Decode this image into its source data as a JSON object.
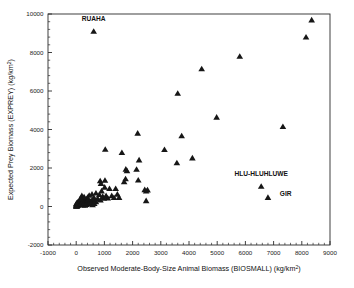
{
  "chart_data": {
    "type": "scatter",
    "title": "",
    "xlabel": "Observed Moderate-Body-Size Animal Biomass (BIOSMALL) (kg/km2)",
    "xlabel_main": "Observed Moderate-Body-Size Animal Biomass (BIOSMALL) (kg/km",
    "xlabel_sup": "2",
    "xlabel_tail": ")",
    "ylabel": "Expected Prey Biomass (EXPREY) (kg/km2)",
    "ylabel_main": "Expected Prey Biomass (EXPREY) (kg/km",
    "ylabel_sup": "2",
    "ylabel_tail": ")",
    "xlim": [
      -1000,
      9000
    ],
    "ylim": [
      -2000,
      10000
    ],
    "xticks": [
      -1000,
      0,
      1000,
      2000,
      3000,
      4000,
      5000,
      6000,
      7000,
      8000,
      9000
    ],
    "yticks": [
      -2000,
      0,
      2000,
      4000,
      6000,
      8000,
      10000
    ],
    "xtick_labels": [
      "-1000",
      "0",
      "1000",
      "2000",
      "3000",
      "4000",
      "5000",
      "6000",
      "7000",
      "8000",
      "9000"
    ],
    "ytick_labels": [
      "-2000",
      "0",
      "2000",
      "4000",
      "6000",
      "8000",
      "10000"
    ],
    "x_minor_interval": 200,
    "y_minor_interval": 400,
    "grid": false,
    "legend": "none",
    "marker": "triangle",
    "marker_color": "#161616",
    "series": [
      {
        "name": "Protected areas",
        "points": [
          [
            620,
            9100
          ],
          [
            8350,
            9690
          ],
          [
            8150,
            8800
          ],
          [
            5800,
            7800
          ],
          [
            4450,
            7150
          ],
          [
            3600,
            5880
          ],
          [
            4980,
            4640
          ],
          [
            7330,
            4150
          ],
          [
            2180,
            3810
          ],
          [
            3740,
            3670
          ],
          [
            1030,
            2970
          ],
          [
            3130,
            2960
          ],
          [
            1620,
            2800
          ],
          [
            4120,
            2520
          ],
          [
            2230,
            2420
          ],
          [
            3570,
            2270
          ],
          [
            1760,
            1940
          ],
          [
            2140,
            1930
          ],
          [
            1800,
            1860
          ],
          [
            1020,
            1360
          ],
          [
            1750,
            1440
          ],
          [
            2200,
            1370
          ],
          [
            850,
            1330
          ],
          [
            880,
            1200
          ],
          [
            6560,
            1050
          ],
          [
            1700,
            1280
          ],
          [
            1010,
            1000
          ],
          [
            1180,
            930
          ],
          [
            2430,
            870
          ],
          [
            2530,
            860
          ],
          [
            2480,
            800
          ],
          [
            900,
            810
          ],
          [
            6800,
            470
          ],
          [
            1520,
            470
          ],
          [
            2480,
            300
          ],
          [
            820,
            620
          ],
          [
            700,
            700
          ],
          [
            560,
            640
          ],
          [
            460,
            580
          ],
          [
            620,
            450
          ],
          [
            980,
            430
          ],
          [
            1120,
            440
          ],
          [
            700,
            250
          ],
          [
            530,
            300
          ],
          [
            400,
            470
          ],
          [
            350,
            380
          ],
          [
            300,
            300
          ],
          [
            260,
            260
          ],
          [
            220,
            420
          ],
          [
            180,
            330
          ],
          [
            160,
            200
          ],
          [
            140,
            160
          ],
          [
            120,
            250
          ],
          [
            100,
            180
          ],
          [
            90,
            120
          ],
          [
            80,
            260
          ],
          [
            70,
            90
          ],
          [
            60,
            200
          ],
          [
            55,
            150
          ],
          [
            50,
            60
          ],
          [
            45,
            110
          ],
          [
            40,
            210
          ],
          [
            35,
            70
          ],
          [
            30,
            140
          ],
          [
            28,
            40
          ],
          [
            25,
            180
          ],
          [
            22,
            95
          ],
          [
            20,
            30
          ],
          [
            18,
            130
          ],
          [
            15,
            60
          ],
          [
            12,
            20
          ],
          [
            10,
            100
          ],
          [
            8,
            45
          ],
          [
            6,
            150
          ],
          [
            5,
            15
          ],
          [
            200,
            560
          ],
          [
            240,
            250
          ],
          [
            280,
            500
          ],
          [
            320,
            180
          ],
          [
            380,
            220
          ],
          [
            420,
            340
          ],
          [
            480,
            250
          ],
          [
            600,
            320
          ],
          [
            660,
            380
          ],
          [
            760,
            420
          ],
          [
            860,
            330
          ],
          [
            940,
            520
          ],
          [
            1060,
            560
          ],
          [
            1260,
            560
          ],
          [
            1340,
            460
          ],
          [
            1400,
            930
          ],
          [
            1460,
            640
          ],
          [
            150,
            420
          ],
          [
            190,
            160
          ],
          [
            230,
            80
          ],
          [
            270,
            120
          ],
          [
            310,
            60
          ],
          [
            360,
            100
          ],
          [
            440,
            140
          ],
          [
            520,
            190
          ],
          [
            580,
            90
          ],
          [
            640,
            160
          ]
        ]
      }
    ],
    "annotations": [
      {
        "text": "RUAHA",
        "x": 620,
        "y": 9100,
        "dx": 0,
        "dy": 560,
        "anchor": "middle"
      },
      {
        "text": "HLU-HLUHLUWE",
        "x": 6560,
        "y": 1050,
        "dx": 0,
        "dy": 560,
        "anchor": "middle"
      },
      {
        "text": "GIR",
        "x": 6800,
        "y": 470,
        "dx": 420,
        "dy": 90,
        "anchor": "start"
      }
    ]
  }
}
